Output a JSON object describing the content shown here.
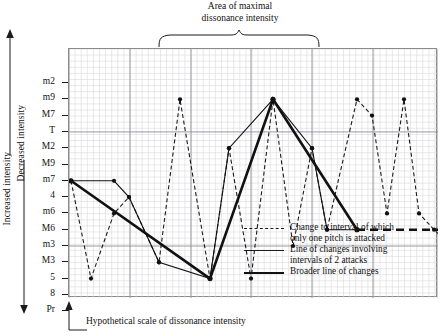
{
  "title": {
    "line1": "Area of maximal",
    "line2": "dissonance intensity"
  },
  "axes": {
    "y_caption_top": "Increased intensity",
    "y_caption_bottom": "Decreased intensity",
    "x_caption": "Hypothetical scale of dissonance intensity"
  },
  "legend": {
    "items": [
      {
        "style": "dashed",
        "line1": "Change to interval of which",
        "line2": "only one pitch is attacked"
      },
      {
        "style": "thin",
        "line1": "Line of changes involving",
        "line2": "intervals of 2 attacks"
      },
      {
        "style": "thick",
        "line1": "Broader line of changes",
        "line2": ""
      }
    ]
  },
  "chart_data": {
    "type": "line",
    "title": "Area of maximal dissonance intensity",
    "xlabel": "Hypothetical scale of dissonance intensity",
    "ylabel": "Increased intensity / Decreased intensity",
    "grid": true,
    "legend_position": "inside-bottom-right",
    "y_categories": [
      "m2",
      "m9",
      "M7",
      "T",
      "M2",
      "M9",
      "m7",
      "4",
      "m6",
      "M6",
      "m3",
      "M3",
      "5",
      "8",
      "Pr"
    ],
    "y_major_gridline_categories": [
      "T",
      "m3"
    ],
    "x_range": [
      0,
      369
    ],
    "x_major_gridlines": [
      0,
      61,
      122,
      182,
      243,
      304,
      369
    ],
    "series": [
      {
        "name": "Change to interval of which only one pitch is attacked",
        "style": "dashed",
        "width": 1.1,
        "markers": true,
        "points": [
          {
            "x": 2,
            "y": "m7"
          },
          {
            "x": 22,
            "y": "5"
          },
          {
            "x": 45,
            "y": "m6"
          },
          {
            "x": 60,
            "y": "4"
          },
          {
            "x": 90,
            "y": "M3"
          },
          {
            "x": 111,
            "y": "m9"
          },
          {
            "x": 141,
            "y": "5"
          },
          {
            "x": 160,
            "y": "M2"
          },
          {
            "x": 182,
            "y": "5"
          },
          {
            "x": 204,
            "y": "m9"
          },
          {
            "x": 224,
            "y": "m3"
          },
          {
            "x": 243,
            "y": "M2"
          },
          {
            "x": 258,
            "y": "M6"
          },
          {
            "x": 288,
            "y": "m9"
          },
          {
            "x": 303,
            "y": "M7"
          },
          {
            "x": 318,
            "y": "m6"
          },
          {
            "x": 335,
            "y": "m9"
          },
          {
            "x": 350,
            "y": "m6"
          },
          {
            "x": 365,
            "y": "M6"
          },
          {
            "x": 382,
            "y": "m3"
          },
          {
            "x": 404,
            "y": "m9"
          },
          {
            "x": 424,
            "y": "M6"
          }
        ]
      },
      {
        "name": "Line of changes involving intervals of 2 attacks",
        "style": "thin",
        "width": 1.1,
        "markers": true,
        "points": [
          {
            "x": 2,
            "y": "m7"
          },
          {
            "x": 45,
            "y": "m7"
          },
          {
            "x": 60,
            "y": "4"
          },
          {
            "x": 90,
            "y": "M3"
          },
          {
            "x": 141,
            "y": "5"
          },
          {
            "x": 160,
            "y": "M2"
          },
          {
            "x": 204,
            "y": "m9"
          },
          {
            "x": 243,
            "y": "M2"
          },
          {
            "x": 258,
            "y": "M6"
          },
          {
            "x": 288,
            "y": "M6"
          }
        ]
      },
      {
        "name": "Broader line of changes",
        "style": "thick",
        "width": 2.6,
        "markers": true,
        "points": [
          {
            "x": 2,
            "y": "m7"
          },
          {
            "x": 141,
            "y": "5"
          },
          {
            "x": 204,
            "y": "m9"
          },
          {
            "x": 288,
            "y": "M6"
          }
        ]
      },
      {
        "name": "Broader line of changes (sustained)",
        "style": "thick-dashed",
        "width": 2.6,
        "markers": false,
        "points": [
          {
            "x": 288,
            "y": "M6"
          },
          {
            "x": 424,
            "y": "M6"
          }
        ]
      }
    ]
  }
}
